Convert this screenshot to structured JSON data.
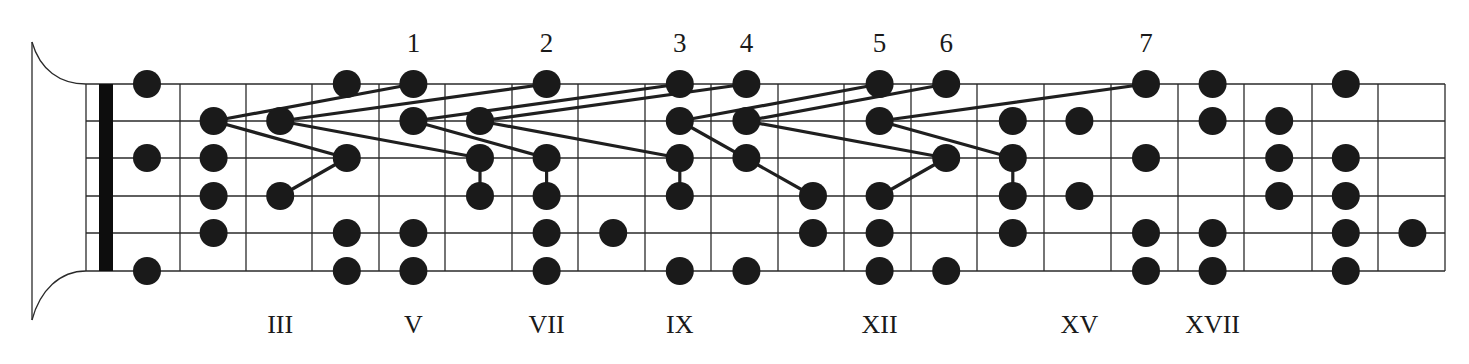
{
  "diagram": {
    "type": "guitar-fretboard-scale-positions",
    "colors": {
      "background": "#ffffff",
      "line": "#2a2a2a",
      "dot": "#1a1a1a",
      "nut": "#0d0d0d",
      "text": "#1a1a1a"
    },
    "geometry": {
      "string_y": [
        84,
        121,
        158,
        196,
        233,
        271
      ],
      "frame_left_x": 86,
      "nut_x": [
        99,
        113
      ],
      "fret_x": [
        180,
        246,
        312,
        379,
        445,
        512,
        578,
        645,
        711,
        778,
        844,
        911,
        977,
        1044,
        1111,
        1178,
        1244,
        1312,
        1378,
        1445
      ],
      "dot_first_x": 147,
      "dot_spacing": 66.6,
      "dot_radius": 14
    },
    "position_numbers": [
      {
        "label": "1",
        "fret": 5
      },
      {
        "label": "2",
        "fret": 7
      },
      {
        "label": "3",
        "fret": 9
      },
      {
        "label": "4",
        "fret": 10
      },
      {
        "label": "5",
        "fret": 12
      },
      {
        "label": "6",
        "fret": 13
      },
      {
        "label": "7",
        "fret": 16
      }
    ],
    "fret_markers": [
      {
        "label": "III",
        "fret": 3
      },
      {
        "label": "V",
        "fret": 5
      },
      {
        "label": "VII",
        "fret": 7
      },
      {
        "label": "IX",
        "fret": 9
      },
      {
        "label": "XII",
        "fret": 12
      },
      {
        "label": "XV",
        "fret": 15
      },
      {
        "label": "XVII",
        "fret": 17
      }
    ],
    "dots": [
      {
        "fret": 1,
        "string": 0
      },
      {
        "fret": 1,
        "string": 2
      },
      {
        "fret": 1,
        "string": 5
      },
      {
        "fret": 2,
        "string": 1
      },
      {
        "fret": 2,
        "string": 2
      },
      {
        "fret": 2,
        "string": 3
      },
      {
        "fret": 2,
        "string": 4
      },
      {
        "fret": 3,
        "string": 1
      },
      {
        "fret": 3,
        "string": 3
      },
      {
        "fret": 4,
        "string": 0
      },
      {
        "fret": 4,
        "string": 2
      },
      {
        "fret": 4,
        "string": 4
      },
      {
        "fret": 4,
        "string": 5
      },
      {
        "fret": 5,
        "string": 0
      },
      {
        "fret": 5,
        "string": 1
      },
      {
        "fret": 5,
        "string": 4
      },
      {
        "fret": 5,
        "string": 5
      },
      {
        "fret": 6,
        "string": 1
      },
      {
        "fret": 6,
        "string": 2
      },
      {
        "fret": 6,
        "string": 3
      },
      {
        "fret": 7,
        "string": 0
      },
      {
        "fret": 7,
        "string": 2
      },
      {
        "fret": 7,
        "string": 3
      },
      {
        "fret": 7,
        "string": 4
      },
      {
        "fret": 7,
        "string": 5
      },
      {
        "fret": 8,
        "string": 4
      },
      {
        "fret": 9,
        "string": 0
      },
      {
        "fret": 9,
        "string": 1
      },
      {
        "fret": 9,
        "string": 2
      },
      {
        "fret": 9,
        "string": 3
      },
      {
        "fret": 9,
        "string": 5
      },
      {
        "fret": 10,
        "string": 0
      },
      {
        "fret": 10,
        "string": 1
      },
      {
        "fret": 10,
        "string": 2
      },
      {
        "fret": 10,
        "string": 5
      },
      {
        "fret": 11,
        "string": 3
      },
      {
        "fret": 11,
        "string": 4
      },
      {
        "fret": 12,
        "string": 0
      },
      {
        "fret": 12,
        "string": 1
      },
      {
        "fret": 12,
        "string": 3
      },
      {
        "fret": 12,
        "string": 4
      },
      {
        "fret": 12,
        "string": 5
      },
      {
        "fret": 13,
        "string": 0
      },
      {
        "fret": 13,
        "string": 2
      },
      {
        "fret": 13,
        "string": 5
      },
      {
        "fret": 14,
        "string": 1
      },
      {
        "fret": 14,
        "string": 2
      },
      {
        "fret": 14,
        "string": 3
      },
      {
        "fret": 14,
        "string": 4
      },
      {
        "fret": 15,
        "string": 1
      },
      {
        "fret": 15,
        "string": 3
      },
      {
        "fret": 16,
        "string": 0
      },
      {
        "fret": 16,
        "string": 2
      },
      {
        "fret": 16,
        "string": 4
      },
      {
        "fret": 16,
        "string": 5
      },
      {
        "fret": 17,
        "string": 0
      },
      {
        "fret": 17,
        "string": 1
      },
      {
        "fret": 17,
        "string": 4
      },
      {
        "fret": 17,
        "string": 5
      },
      {
        "fret": 18,
        "string": 1
      },
      {
        "fret": 18,
        "string": 2
      },
      {
        "fret": 18,
        "string": 3
      },
      {
        "fret": 19,
        "string": 0
      },
      {
        "fret": 19,
        "string": 2
      },
      {
        "fret": 19,
        "string": 3
      },
      {
        "fret": 19,
        "string": 4
      },
      {
        "fret": 19,
        "string": 5
      },
      {
        "fret": 20,
        "string": 4
      }
    ],
    "connectors": [
      {
        "from": [
          2,
          1
        ],
        "to": [
          5,
          0
        ]
      },
      {
        "from": [
          2,
          1
        ],
        "to": [
          4,
          2
        ]
      },
      {
        "from": [
          4,
          2
        ],
        "to": [
          3,
          3
        ]
      },
      {
        "from": [
          3,
          1
        ],
        "to": [
          7,
          0
        ]
      },
      {
        "from": [
          3,
          1
        ],
        "to": [
          6,
          2
        ]
      },
      {
        "from": [
          5,
          1
        ],
        "to": [
          9,
          0
        ]
      },
      {
        "from": [
          5,
          1
        ],
        "to": [
          7,
          2
        ]
      },
      {
        "from": [
          6,
          2
        ],
        "to": [
          6,
          3
        ]
      },
      {
        "from": [
          7,
          2
        ],
        "to": [
          7,
          3
        ]
      },
      {
        "from": [
          6,
          1
        ],
        "to": [
          10,
          0
        ]
      },
      {
        "from": [
          6,
          1
        ],
        "to": [
          9,
          2
        ]
      },
      {
        "from": [
          9,
          2
        ],
        "to": [
          9,
          3
        ]
      },
      {
        "from": [
          9,
          1
        ],
        "to": [
          12,
          0
        ]
      },
      {
        "from": [
          9,
          1
        ],
        "to": [
          11,
          3
        ]
      },
      {
        "from": [
          10,
          1
        ],
        "to": [
          13,
          0
        ]
      },
      {
        "from": [
          10,
          1
        ],
        "to": [
          13,
          2
        ]
      },
      {
        "from": [
          13,
          2
        ],
        "to": [
          12,
          3
        ]
      },
      {
        "from": [
          12,
          1
        ],
        "to": [
          16,
          0
        ]
      },
      {
        "from": [
          12,
          1
        ],
        "to": [
          14,
          2
        ]
      },
      {
        "from": [
          14,
          2
        ],
        "to": [
          14,
          3
        ]
      }
    ]
  }
}
